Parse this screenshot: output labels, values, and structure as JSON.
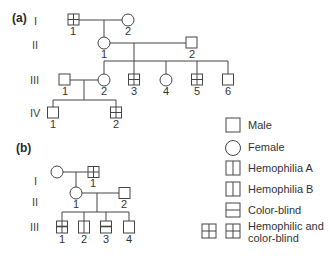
{
  "panels": {
    "a": {
      "label": "(a)",
      "generations": [
        "I",
        "II",
        "III",
        "IV"
      ],
      "individuals": [
        {
          "id": "I-1",
          "num": "1",
          "sex": "male",
          "phenotype": "hemophilic and color-blind"
        },
        {
          "id": "I-2",
          "num": "2",
          "sex": "female",
          "phenotype": "unaffected"
        },
        {
          "id": "II-1",
          "num": "1",
          "sex": "female",
          "phenotype": "unaffected"
        },
        {
          "id": "II-2",
          "num": "2",
          "sex": "male",
          "phenotype": "unaffected"
        },
        {
          "id": "III-1",
          "num": "1",
          "sex": "male",
          "phenotype": "unaffected"
        },
        {
          "id": "III-2",
          "num": "2",
          "sex": "female",
          "phenotype": "unaffected"
        },
        {
          "id": "III-3",
          "num": "3",
          "sex": "male",
          "phenotype": "hemophilic and color-blind"
        },
        {
          "id": "III-4",
          "num": "4",
          "sex": "female",
          "phenotype": "unaffected"
        },
        {
          "id": "III-5",
          "num": "5",
          "sex": "male",
          "phenotype": "hemophilic and color-blind"
        },
        {
          "id": "III-6",
          "num": "6",
          "sex": "male",
          "phenotype": "unaffected"
        },
        {
          "id": "IV-1",
          "num": "1",
          "sex": "male",
          "phenotype": "unaffected"
        },
        {
          "id": "IV-2",
          "num": "2",
          "sex": "male",
          "phenotype": "hemophilic and color-blind"
        }
      ]
    },
    "b": {
      "label": "(b)",
      "generations": [
        "I",
        "II",
        "III"
      ],
      "individuals": [
        {
          "id": "I-1",
          "num": "",
          "sex": "female",
          "phenotype": "unaffected"
        },
        {
          "id": "I-2",
          "num": "1",
          "sex": "male",
          "phenotype": "hemophilic and color-blind"
        },
        {
          "id": "II-1",
          "num": "1",
          "sex": "female",
          "phenotype": "unaffected"
        },
        {
          "id": "II-2",
          "num": "2",
          "sex": "male",
          "phenotype": "unaffected"
        },
        {
          "id": "III-1",
          "num": "1",
          "sex": "male",
          "phenotype": "hemophilic and color-blind"
        },
        {
          "id": "III-2",
          "num": "2",
          "sex": "male",
          "phenotype": "hemophilia"
        },
        {
          "id": "III-3",
          "num": "3",
          "sex": "male",
          "phenotype": "color-blind"
        },
        {
          "id": "III-4",
          "num": "4",
          "sex": "male",
          "phenotype": "unaffected"
        }
      ]
    }
  },
  "legend": [
    {
      "symbol": "male",
      "label": "Male"
    },
    {
      "symbol": "female",
      "label": "Female"
    },
    {
      "symbol": "hemophilia-a",
      "label": "Hemophilia A"
    },
    {
      "symbol": "hemophilia-b",
      "label": "Hemophilia B"
    },
    {
      "symbol": "color-blind",
      "label": "Color-blind"
    },
    {
      "symbol": "hemophilic-color-blind",
      "label_line1": "Hemophilic and",
      "label_line2": "color-blind"
    }
  ],
  "colors": {
    "line": "#444444",
    "background": "#ffffff"
  }
}
